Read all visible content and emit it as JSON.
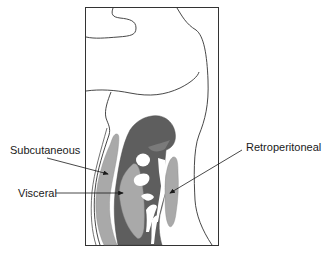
{
  "diagram": {
    "type": "anatomical-cross-section",
    "colors": {
      "outline": "#333333",
      "dark_tissue": "#5e5e5e",
      "light_fat": "#a9a9a9",
      "background": "#ffffff"
    },
    "labels": {
      "subcutaneous": "Subcutaneous",
      "visceral": "Visceral",
      "retroperitoneal": "Retroperitoneal"
    }
  }
}
